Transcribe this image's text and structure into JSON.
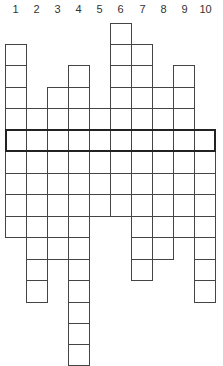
{
  "puzzle": {
    "type": "crossword-column-grid",
    "column_numbers": [
      "1",
      "2",
      "3",
      "4",
      "5",
      "6",
      "7",
      "8",
      "9",
      "10"
    ],
    "grid": {
      "origin_x": 5,
      "cell_size": 21.1,
      "row_lines_y": [
        23,
        44,
        65,
        87,
        108,
        130,
        151,
        173,
        194,
        216,
        237,
        259,
        280,
        302,
        323,
        344
      ],
      "columns": [
        {
          "number": "1",
          "top_row": 1,
          "bottom_row": 9
        },
        {
          "number": "2",
          "top_row": 4,
          "bottom_row": 12
        },
        {
          "number": "3",
          "top_row": 3,
          "bottom_row": 10
        },
        {
          "number": "4",
          "top_row": 2,
          "bottom_row": 15
        },
        {
          "number": "5",
          "top_row": 4,
          "bottom_row": 8
        },
        {
          "number": "6",
          "top_row": 0,
          "bottom_row": 8
        },
        {
          "number": "7",
          "top_row": 1,
          "bottom_row": 11
        },
        {
          "number": "8",
          "top_row": 3,
          "bottom_row": 10
        },
        {
          "number": "9",
          "top_row": 2,
          "bottom_row": 9
        },
        {
          "number": "10",
          "top_row": 5,
          "bottom_row": 12
        }
      ],
      "highlighted_row": 5,
      "highlight_color": "#222222",
      "line_color": "#444444"
    }
  }
}
